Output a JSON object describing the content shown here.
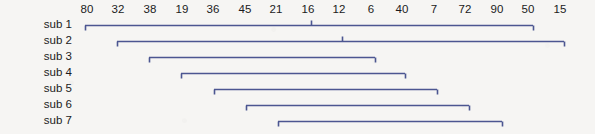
{
  "figure": {
    "title": "",
    "background_color": "#f6f5f3",
    "line_color": "#4c5691",
    "text_color": "#1b1b1b"
  },
  "chart_data": {
    "type": "bar",
    "orientation": "horizontal",
    "title": "",
    "xlabel": "",
    "ylabel": "",
    "grid": false,
    "legend": null,
    "axis": {
      "position": "top",
      "tick_labels": [
        "80",
        "32",
        "38",
        "19",
        "36",
        "45",
        "21",
        "16",
        "12",
        "6",
        "40",
        "7",
        "72",
        "90",
        "50",
        "15"
      ],
      "tick_x_px": [
        87,
        118,
        150,
        182,
        213,
        245,
        276,
        308,
        339,
        371,
        402,
        434,
        465,
        497,
        528,
        560
      ],
      "tick_spacing_px": 31.5
    },
    "categories": [
      "sub 1",
      "sub 2",
      "sub 3",
      "sub 4",
      "sub 5",
      "sub 6",
      "sub 7"
    ],
    "bars": [
      {
        "label": "sub 1",
        "start_px": 85,
        "end_px": 533,
        "row_y_px": 25,
        "start_cap": "down",
        "end_cap": "down",
        "mid_cap_x_px": 311,
        "mid_cap": "up"
      },
      {
        "label": "sub 2",
        "start_px": 117,
        "end_px": 564,
        "row_y_px": 41,
        "start_cap": "down",
        "end_cap": "down",
        "mid_cap_x_px": 342,
        "mid_cap": "up"
      },
      {
        "label": "sub 3",
        "start_px": 149,
        "end_px": 375,
        "row_y_px": 57,
        "start_cap": "down",
        "end_cap": "down",
        "mid_cap_x_px": null,
        "mid_cap": null
      },
      {
        "label": "sub 4",
        "start_px": 181,
        "end_px": 405,
        "row_y_px": 73,
        "start_cap": "down",
        "end_cap": "down",
        "mid_cap_x_px": null,
        "mid_cap": null
      },
      {
        "label": "sub 5",
        "start_px": 214,
        "end_px": 437,
        "row_y_px": 89,
        "start_cap": "down",
        "end_cap": "down",
        "mid_cap_x_px": null,
        "mid_cap": null
      },
      {
        "label": "sub 6",
        "start_px": 246,
        "end_px": 469,
        "row_y_px": 105,
        "start_cap": "down",
        "end_cap": "down",
        "mid_cap_x_px": null,
        "mid_cap": null
      },
      {
        "label": "sub 7",
        "start_px": 278,
        "end_px": 502,
        "row_y_px": 121,
        "start_cap": "down",
        "end_cap": "down",
        "mid_cap_x_px": null,
        "mid_cap": null
      }
    ],
    "values": [
      448,
      447,
      226,
      224,
      223,
      223,
      224
    ]
  }
}
